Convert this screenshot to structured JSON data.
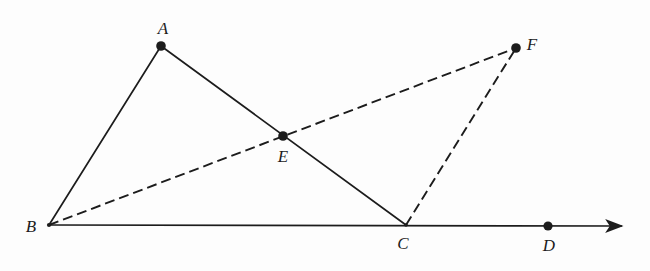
{
  "figure": {
    "kind": "geometry-diagram",
    "background_color": "#fdfdfd",
    "stroke_color": "#1c1c1c",
    "canvas": {
      "width": 650,
      "height": 271
    },
    "labels": {
      "A": "A",
      "B": "B",
      "C": "C",
      "D": "D",
      "E": "E",
      "F": "F"
    },
    "points": [
      {
        "id": "A",
        "label": "A",
        "x": 161,
        "y": 46,
        "marker": "filled-dot",
        "label_x": 163,
        "label_y": 28
      },
      {
        "id": "B",
        "label": "B",
        "x": 49,
        "y": 225,
        "marker": "vertex",
        "label_x": 31,
        "label_y": 226
      },
      {
        "id": "C",
        "label": "C",
        "x": 406,
        "y": 225,
        "marker": "vertex",
        "label_x": 403,
        "label_y": 243
      },
      {
        "id": "D",
        "label": "D",
        "x": 548,
        "y": 226,
        "marker": "filled-dot",
        "label_x": 549,
        "label_y": 245
      },
      {
        "id": "E",
        "label": "E",
        "x": 283,
        "y": 136,
        "marker": "filled-dot",
        "label_x": 283,
        "label_y": 156
      },
      {
        "id": "F",
        "label": "F",
        "x": 516,
        "y": 48,
        "marker": "filled-dot",
        "label_x": 532,
        "label_y": 44
      }
    ],
    "segments": [
      {
        "id": "BA",
        "from": "B",
        "to": "A",
        "style": "solid"
      },
      {
        "id": "AC",
        "from": "A",
        "to": "C",
        "style": "solid"
      },
      {
        "id": "BF",
        "from": "B",
        "to": "F",
        "style": "dashed"
      },
      {
        "id": "CF",
        "from": "C",
        "to": "F",
        "style": "dashed"
      }
    ],
    "ray": {
      "id": "BD-ray",
      "from": "B",
      "through": [
        "C",
        "D"
      ],
      "style": "solid",
      "arrowhead": true,
      "tip_x": 622,
      "tip_y": 226
    },
    "dash_pattern": "10 5",
    "stroke_width": 1.7,
    "dot_radius": 4.6
  }
}
